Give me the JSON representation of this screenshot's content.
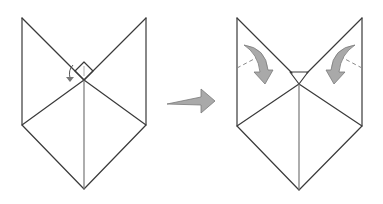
{
  "diagram": {
    "type": "origami-step",
    "steps": [
      {
        "id": "before",
        "description": "Fox face base with small diamond flap at center; small curved arrow indicating fold-down of top point",
        "colors": {
          "line": "#3a3a3a"
        }
      },
      {
        "id": "after",
        "description": "Small triangle folded down at center; two large curved arrows indicating folding side flaps inward along dashed lines",
        "colors": {
          "line": "#3a3a3a",
          "arrow_fill": "#a9a9a9"
        }
      }
    ],
    "transition_arrow": {
      "direction": "right",
      "color": "#a9a9a9"
    }
  }
}
